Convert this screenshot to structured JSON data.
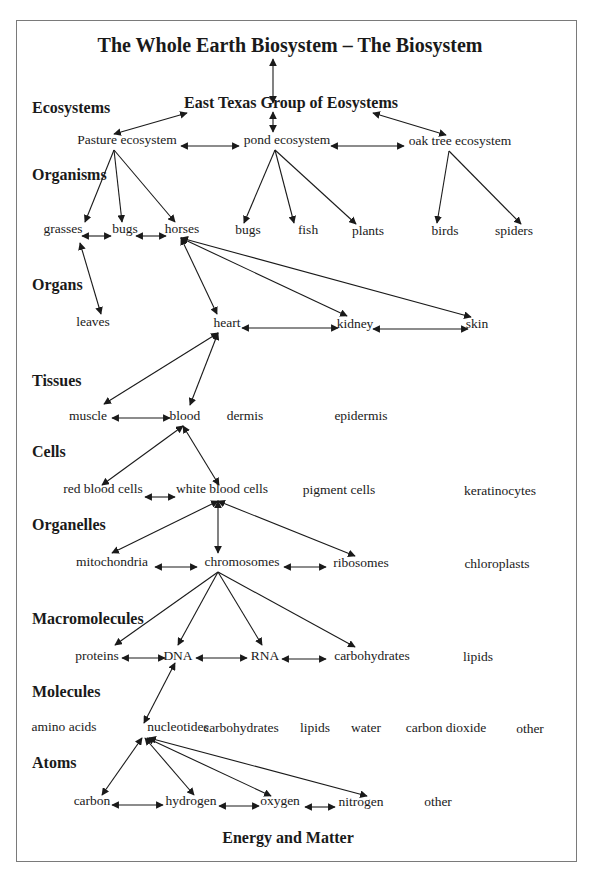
{
  "diagram": {
    "title": "The Whole Earth Biosystem – The Biosystem",
    "group": "East Texas Group of Eosystems",
    "footer": "Energy and Matter",
    "levels": [
      {
        "id": "ecosystems",
        "label": "Ecosystems",
        "x": 32,
        "y": 108
      },
      {
        "id": "organisms",
        "label": "Organisms",
        "x": 32,
        "y": 175
      },
      {
        "id": "organs",
        "label": "Organs",
        "x": 32,
        "y": 285
      },
      {
        "id": "tissues",
        "label": "Tissues",
        "x": 32,
        "y": 381
      },
      {
        "id": "cells",
        "label": "Cells",
        "x": 32,
        "y": 452
      },
      {
        "id": "organelles",
        "label": "Organelles",
        "x": 32,
        "y": 525
      },
      {
        "id": "macromolecules",
        "label": "Macromolecules",
        "x": 32,
        "y": 619
      },
      {
        "id": "molecules",
        "label": "Molecules",
        "x": 32,
        "y": 692
      },
      {
        "id": "atoms",
        "label": "Atoms",
        "x": 32,
        "y": 763
      }
    ],
    "nodes": [
      {
        "id": "pasture",
        "label": "Pasture ecosystem",
        "x": 127,
        "y": 140
      },
      {
        "id": "pond",
        "label": "pond ecosystem",
        "x": 287,
        "y": 140
      },
      {
        "id": "oak",
        "label": "oak tree ecosystem",
        "x": 460,
        "y": 141
      },
      {
        "id": "grasses",
        "label": "grasses",
        "x": 63,
        "y": 229
      },
      {
        "id": "bugs1",
        "label": "bugs",
        "x": 125,
        "y": 229
      },
      {
        "id": "horses",
        "label": "horses",
        "x": 182,
        "y": 229
      },
      {
        "id": "bugs2",
        "label": "bugs",
        "x": 248,
        "y": 230
      },
      {
        "id": "fish",
        "label": "fish",
        "x": 308,
        "y": 230
      },
      {
        "id": "plants",
        "label": "plants",
        "x": 368,
        "y": 231
      },
      {
        "id": "birds",
        "label": "birds",
        "x": 445,
        "y": 231
      },
      {
        "id": "spiders",
        "label": "spiders",
        "x": 514,
        "y": 231
      },
      {
        "id": "leaves",
        "label": "leaves",
        "x": 93,
        "y": 322
      },
      {
        "id": "heart",
        "label": "heart",
        "x": 227,
        "y": 323
      },
      {
        "id": "kidney",
        "label": "kidney",
        "x": 355,
        "y": 324
      },
      {
        "id": "skin",
        "label": "skin",
        "x": 477,
        "y": 324
      },
      {
        "id": "muscle",
        "label": "muscle",
        "x": 88,
        "y": 416
      },
      {
        "id": "blood",
        "label": "blood",
        "x": 185,
        "y": 416
      },
      {
        "id": "dermis",
        "label": "dermis",
        "x": 245,
        "y": 416
      },
      {
        "id": "epidermis",
        "label": "epidermis",
        "x": 361,
        "y": 416
      },
      {
        "id": "rbc",
        "label": "red blood cells",
        "x": 103,
        "y": 489
      },
      {
        "id": "wbc",
        "label": "white blood cells",
        "x": 222,
        "y": 489
      },
      {
        "id": "pigment",
        "label": "pigment cells",
        "x": 339,
        "y": 490
      },
      {
        "id": "keratinocytes",
        "label": "keratinocytes",
        "x": 500,
        "y": 491
      },
      {
        "id": "mito",
        "label": "mitochondria",
        "x": 112,
        "y": 562
      },
      {
        "id": "chromo",
        "label": "chromosomes",
        "x": 242,
        "y": 562
      },
      {
        "id": "ribo",
        "label": "ribosomes",
        "x": 361,
        "y": 563
      },
      {
        "id": "chloro",
        "label": "chloroplasts",
        "x": 497,
        "y": 564
      },
      {
        "id": "proteins",
        "label": "proteins",
        "x": 97,
        "y": 656
      },
      {
        "id": "dna",
        "label": "DNA",
        "x": 178,
        "y": 656
      },
      {
        "id": "rna",
        "label": "RNA",
        "x": 265,
        "y": 656
      },
      {
        "id": "carbs1",
        "label": "carbohydrates",
        "x": 372,
        "y": 656
      },
      {
        "id": "lipids1",
        "label": "lipids",
        "x": 478,
        "y": 657
      },
      {
        "id": "amino",
        "label": "amino acids",
        "x": 64,
        "y": 727
      },
      {
        "id": "nucleo",
        "label": "nucleotides",
        "x": 178,
        "y": 727
      },
      {
        "id": "carbs2",
        "label": "carbohydrates",
        "x": 241,
        "y": 728
      },
      {
        "id": "lipids2",
        "label": "lipids",
        "x": 315,
        "y": 728
      },
      {
        "id": "water",
        "label": "water",
        "x": 366,
        "y": 728
      },
      {
        "id": "co2",
        "label": "carbon dioxide",
        "x": 446,
        "y": 728
      },
      {
        "id": "other1",
        "label": "other",
        "x": 530,
        "y": 729
      },
      {
        "id": "carbon",
        "label": "carbon",
        "x": 92,
        "y": 801
      },
      {
        "id": "hydrogen",
        "label": "hydrogen",
        "x": 191,
        "y": 801
      },
      {
        "id": "oxygen",
        "label": "oxygen",
        "x": 280,
        "y": 801
      },
      {
        "id": "nitrogen",
        "label": "nitrogen",
        "x": 361,
        "y": 802
      },
      {
        "id": "other2",
        "label": "other",
        "x": 438,
        "y": 802
      }
    ],
    "edges": [
      {
        "x1": 273,
        "y1": 59,
        "x2": 273,
        "y2": 103,
        "both": true
      },
      {
        "x1": 273,
        "y1": 112,
        "x2": 273,
        "y2": 132,
        "both": true
      },
      {
        "x1": 187,
        "y1": 113,
        "x2": 114,
        "y2": 134,
        "both": true
      },
      {
        "x1": 373,
        "y1": 113,
        "x2": 446,
        "y2": 135,
        "both": true
      },
      {
        "x1": 181,
        "y1": 146,
        "x2": 239,
        "y2": 146,
        "both": true
      },
      {
        "x1": 331,
        "y1": 146,
        "x2": 404,
        "y2": 146,
        "both": true
      },
      {
        "x1": 114,
        "y1": 150,
        "x2": 85,
        "y2": 222,
        "both": false
      },
      {
        "x1": 114,
        "y1": 150,
        "x2": 122,
        "y2": 222,
        "both": false
      },
      {
        "x1": 114,
        "y1": 150,
        "x2": 175,
        "y2": 222,
        "both": false
      },
      {
        "x1": 275,
        "y1": 150,
        "x2": 244,
        "y2": 223,
        "both": false
      },
      {
        "x1": 275,
        "y1": 150,
        "x2": 294,
        "y2": 223,
        "both": false
      },
      {
        "x1": 275,
        "y1": 150,
        "x2": 356,
        "y2": 224,
        "both": false
      },
      {
        "x1": 449,
        "y1": 151,
        "x2": 437,
        "y2": 223,
        "both": false
      },
      {
        "x1": 449,
        "y1": 151,
        "x2": 521,
        "y2": 224,
        "both": false
      },
      {
        "x1": 82,
        "y1": 236,
        "x2": 111,
        "y2": 236,
        "both": true
      },
      {
        "x1": 136,
        "y1": 236,
        "x2": 166,
        "y2": 236,
        "both": true
      },
      {
        "x1": 80,
        "y1": 243,
        "x2": 101,
        "y2": 314,
        "both": true
      },
      {
        "x1": 181,
        "y1": 238,
        "x2": 217,
        "y2": 314,
        "both": true
      },
      {
        "x1": 181,
        "y1": 238,
        "x2": 347,
        "y2": 316,
        "both": true
      },
      {
        "x1": 181,
        "y1": 238,
        "x2": 471,
        "y2": 317,
        "both": true
      },
      {
        "x1": 242,
        "y1": 328,
        "x2": 338,
        "y2": 328,
        "both": true
      },
      {
        "x1": 373,
        "y1": 329,
        "x2": 468,
        "y2": 329,
        "both": true
      },
      {
        "x1": 218,
        "y1": 333,
        "x2": 104,
        "y2": 404,
        "both": true
      },
      {
        "x1": 218,
        "y1": 333,
        "x2": 190,
        "y2": 405,
        "both": true
      },
      {
        "x1": 112,
        "y1": 418,
        "x2": 170,
        "y2": 418,
        "both": true
      },
      {
        "x1": 183,
        "y1": 426,
        "x2": 102,
        "y2": 485,
        "both": true
      },
      {
        "x1": 183,
        "y1": 426,
        "x2": 219,
        "y2": 485,
        "both": true
      },
      {
        "x1": 145,
        "y1": 497,
        "x2": 175,
        "y2": 497,
        "both": true
      },
      {
        "x1": 218,
        "y1": 501,
        "x2": 112,
        "y2": 553,
        "both": true
      },
      {
        "x1": 218,
        "y1": 501,
        "x2": 218,
        "y2": 553,
        "both": true
      },
      {
        "x1": 218,
        "y1": 501,
        "x2": 355,
        "y2": 556,
        "both": true
      },
      {
        "x1": 155,
        "y1": 567,
        "x2": 197,
        "y2": 567,
        "both": true
      },
      {
        "x1": 284,
        "y1": 567,
        "x2": 326,
        "y2": 567,
        "both": true
      },
      {
        "x1": 218,
        "y1": 572,
        "x2": 115,
        "y2": 645,
        "both": false
      },
      {
        "x1": 218,
        "y1": 572,
        "x2": 178,
        "y2": 645,
        "both": false
      },
      {
        "x1": 218,
        "y1": 572,
        "x2": 262,
        "y2": 645,
        "both": false
      },
      {
        "x1": 218,
        "y1": 572,
        "x2": 355,
        "y2": 647,
        "both": false
      },
      {
        "x1": 122,
        "y1": 658,
        "x2": 165,
        "y2": 658,
        "both": true
      },
      {
        "x1": 196,
        "y1": 658,
        "x2": 247,
        "y2": 658,
        "both": true
      },
      {
        "x1": 282,
        "y1": 659,
        "x2": 326,
        "y2": 659,
        "both": true
      },
      {
        "x1": 175,
        "y1": 663,
        "x2": 144,
        "y2": 723,
        "both": true
      },
      {
        "x1": 142,
        "y1": 738,
        "x2": 102,
        "y2": 795,
        "both": true
      },
      {
        "x1": 145,
        "y1": 738,
        "x2": 194,
        "y2": 795,
        "both": true
      },
      {
        "x1": 147,
        "y1": 738,
        "x2": 271,
        "y2": 796,
        "both": true
      },
      {
        "x1": 149,
        "y1": 738,
        "x2": 367,
        "y2": 796,
        "both": true
      },
      {
        "x1": 112,
        "y1": 805,
        "x2": 163,
        "y2": 805,
        "both": true
      },
      {
        "x1": 219,
        "y1": 806,
        "x2": 259,
        "y2": 806,
        "both": true
      },
      {
        "x1": 305,
        "y1": 807,
        "x2": 335,
        "y2": 807,
        "both": true
      }
    ]
  }
}
